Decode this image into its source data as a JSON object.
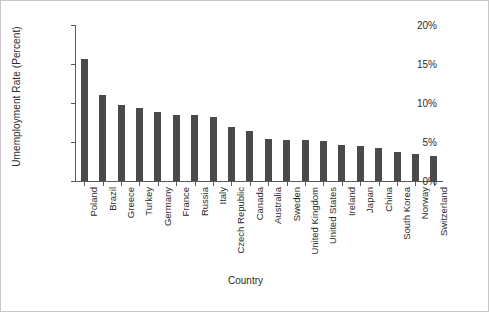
{
  "chart_data": {
    "type": "bar",
    "title": "",
    "xlabel": "Country",
    "ylabel": "Umemployment Rate (Percent)",
    "ylim": [
      0,
      20
    ],
    "ytick_labels": [
      "0%",
      "5%",
      "10%",
      "15%",
      "20%"
    ],
    "ytick_values": [
      0,
      5,
      10,
      15,
      20
    ],
    "grid": false,
    "legend": false,
    "bar_color": "#4a4a4a",
    "axis_color": "#595959",
    "background_color": "#ffffff",
    "categories": [
      "Poland",
      "Brazil",
      "Greece",
      "Turkey",
      "Germany",
      "France",
      "Russia",
      "Italy",
      "Czech Republic",
      "Canada",
      "Australia",
      "Sweden",
      "United Kingdom",
      "United States",
      "Ireland",
      "Japan",
      "China",
      "South Korea",
      "Norway",
      "Switzerland"
    ],
    "values": [
      15.7,
      11.0,
      9.8,
      9.3,
      8.8,
      8.5,
      8.4,
      8.2,
      6.9,
      6.4,
      5.4,
      5.3,
      5.2,
      5.1,
      4.6,
      4.5,
      4.2,
      3.7,
      3.4,
      3.2
    ]
  }
}
